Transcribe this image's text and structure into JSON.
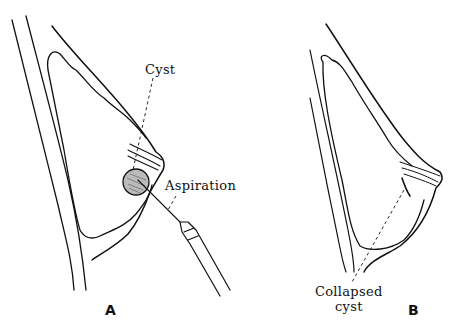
{
  "figure": {
    "panels": [
      {
        "id": "A",
        "label": "A",
        "annotations": {
          "cyst": "Cyst",
          "aspiration": "Aspiration"
        }
      },
      {
        "id": "B",
        "label": "B",
        "annotations": {
          "collapsed_line1": "Collapsed",
          "collapsed_line2": "cyst"
        }
      }
    ]
  }
}
